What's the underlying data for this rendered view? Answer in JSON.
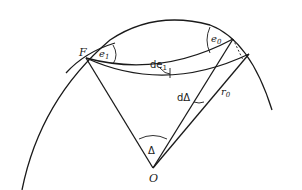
{
  "diagram": {
    "type": "geometry",
    "labels": {
      "focus": "F",
      "center": "O",
      "angle_e1": "e",
      "angle_e1_sub": "1",
      "angle_e0": "e",
      "angle_e0_sub": "0",
      "angle_de1": "de",
      "angle_de1_sub": "1",
      "angle_dDelta": "dΔ",
      "radius": "r",
      "radius_sub": "0",
      "angle_Delta": "Δ"
    },
    "colors": {
      "stroke": "#1a1a1a",
      "background": "#ffffff"
    }
  }
}
